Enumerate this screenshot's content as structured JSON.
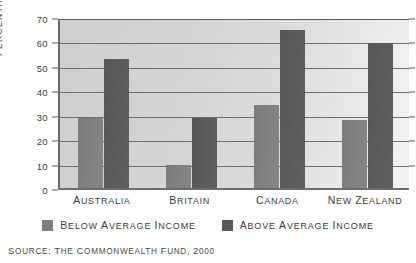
{
  "chart_data": {
    "type": "bar",
    "title": "",
    "xlabel": "",
    "ylabel": "PERCENTAGE",
    "ylim": [
      0,
      70
    ],
    "yticks": [
      0,
      10,
      20,
      30,
      40,
      50,
      60,
      70
    ],
    "grid": true,
    "legend_position": "bottom",
    "categories": [
      "AUSTRALIA",
      "BRITAIN",
      "CANADA",
      "NEW ZEALAND"
    ],
    "series": [
      {
        "name": "BELOW AVERAGE INCOME",
        "color": "#7f7f7f",
        "values": [
          28.5,
          9.5,
          34,
          28
        ]
      },
      {
        "name": "ABOVE AVERAGE INCOME",
        "color": "#5a5a5a",
        "values": [
          53,
          28.5,
          64.5,
          59.5
        ]
      }
    ],
    "source": "SOURCE: THE COMMONWEALTH FUND, 2000"
  },
  "axis": {
    "y_title": "PERCENTAGE",
    "tick_labels": [
      "70",
      "60",
      "50",
      "40",
      "30",
      "20",
      "10",
      "0"
    ]
  },
  "legend": {
    "items": [
      {
        "label": "BELOW AVERAGE INCOME",
        "swatch": "below"
      },
      {
        "label": "ABOVE AVERAGE INCOME",
        "swatch": "above"
      }
    ]
  },
  "footer": {
    "source": "SOURCE: THE COMMONWEALTH FUND, 2000"
  },
  "colors": {
    "below_average": "#7f7f7f",
    "above_average": "#5a5a5a",
    "plot_background": "#d8d8d8",
    "axis": "#6d6d6d",
    "text": "#3b3b3b"
  }
}
